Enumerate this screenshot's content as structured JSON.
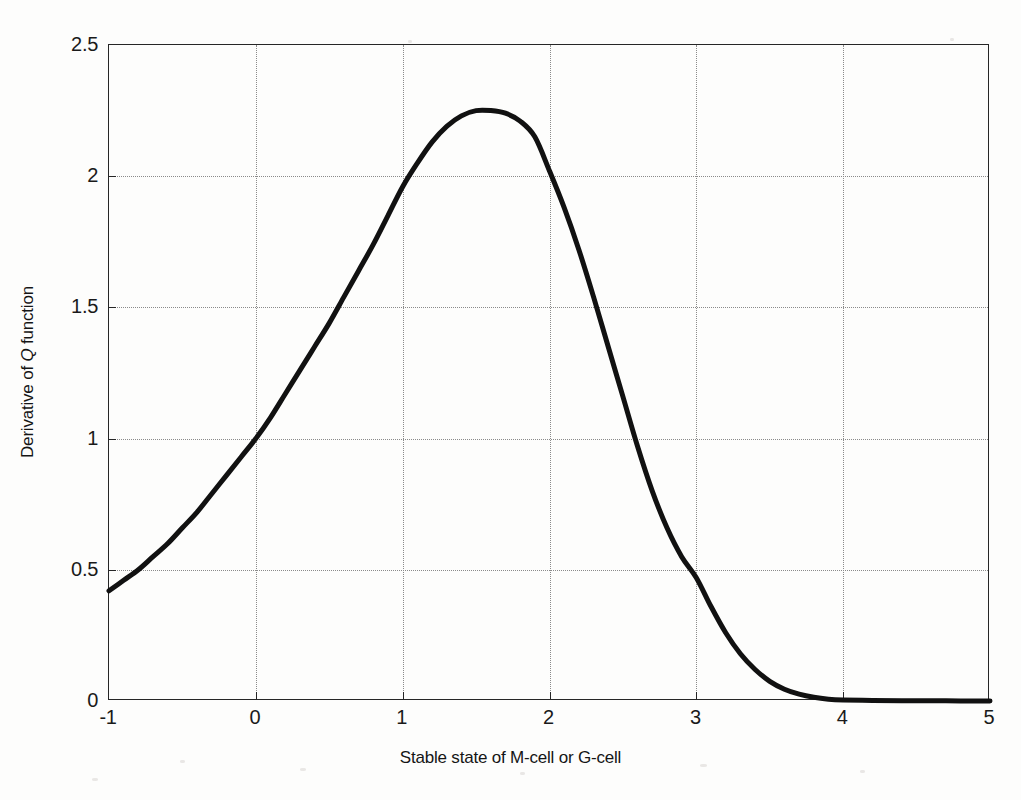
{
  "figure": {
    "background_color": "#fdfdfc",
    "axis_color": "#262626",
    "grid_color": "#8a8a8a",
    "curve_color": "#111111"
  },
  "chart_data": {
    "type": "line",
    "title": "",
    "xlabel": "Stable state of M-cell or G-cell",
    "ylabel": "Derivative of Q function",
    "ylabel_parts": {
      "before": "Derivative of ",
      "italic": "Q",
      "after": " function"
    },
    "xlim": [
      -1,
      5
    ],
    "ylim": [
      0,
      2.5
    ],
    "xticks": [
      -1,
      0,
      1,
      2,
      3,
      4,
      5
    ],
    "xticklabels": [
      "-1",
      "0",
      "1",
      "2",
      "3",
      "4",
      "5"
    ],
    "yticks": [
      0,
      0.5,
      1,
      1.5,
      2,
      2.5
    ],
    "yticklabels": [
      "0",
      "0.5",
      "1",
      "1.5",
      "2",
      "2.5"
    ],
    "grid": true,
    "grid_style": "dotted",
    "legend": null,
    "series": [
      {
        "name": "Derivative of Q function",
        "color": "#111111",
        "linewidth": 4,
        "x": [
          -1.0,
          -0.9,
          -0.8,
          -0.7,
          -0.6,
          -0.5,
          -0.4,
          -0.3,
          -0.2,
          -0.1,
          0.0,
          0.1,
          0.2,
          0.3,
          0.4,
          0.5,
          0.6,
          0.7,
          0.8,
          0.9,
          1.0,
          1.1,
          1.2,
          1.3,
          1.4,
          1.5,
          1.6,
          1.7,
          1.8,
          1.9,
          2.0,
          2.1,
          2.2,
          2.3,
          2.4,
          2.5,
          2.6,
          2.7,
          2.8,
          2.9,
          3.0,
          3.1,
          3.2,
          3.3,
          3.4,
          3.5,
          3.6,
          3.7,
          3.8,
          3.9,
          4.0,
          4.2,
          4.4,
          4.6,
          4.8,
          5.0
        ],
        "y": [
          0.42,
          0.46,
          0.5,
          0.55,
          0.6,
          0.66,
          0.72,
          0.79,
          0.86,
          0.93,
          1.0,
          1.08,
          1.17,
          1.26,
          1.35,
          1.44,
          1.54,
          1.64,
          1.74,
          1.85,
          1.96,
          2.05,
          2.13,
          2.19,
          2.23,
          2.25,
          2.25,
          2.24,
          2.21,
          2.15,
          2.02,
          1.88,
          1.72,
          1.54,
          1.35,
          1.16,
          0.97,
          0.8,
          0.66,
          0.55,
          0.47,
          0.36,
          0.26,
          0.18,
          0.12,
          0.075,
          0.045,
          0.026,
          0.014,
          0.007,
          0.004,
          0.002,
          0.001,
          0.001,
          0.0,
          0.0
        ],
        "peak": {
          "x": 1.62,
          "y": 2.25
        }
      }
    ],
    "annotations": []
  }
}
